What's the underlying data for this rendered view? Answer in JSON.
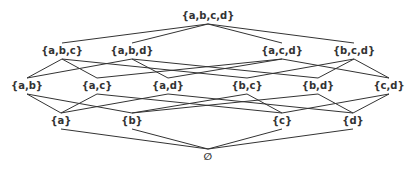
{
  "diagram": {
    "title": "",
    "type": "hasse-diagram-powerset",
    "line_color": "#333333",
    "text_color": "#333333",
    "nodes": [
      {
        "id": "abcd",
        "label": "{a,b,c,d}",
        "x": 208,
        "y": 16
      },
      {
        "id": "abc",
        "label": "{a,b,c}",
        "x": 62,
        "y": 51
      },
      {
        "id": "abd",
        "label": "{a,b,d}",
        "x": 132,
        "y": 51
      },
      {
        "id": "acd",
        "label": "{a,c,d}",
        "x": 282,
        "y": 51
      },
      {
        "id": "bcd",
        "label": "{b,c,d}",
        "x": 354,
        "y": 51
      },
      {
        "id": "ab",
        "label": "{a,b}",
        "x": 27,
        "y": 86
      },
      {
        "id": "ac",
        "label": "{a,c}",
        "x": 97,
        "y": 86
      },
      {
        "id": "ad",
        "label": "{a,d}",
        "x": 168,
        "y": 86
      },
      {
        "id": "bc",
        "label": "{b,c}",
        "x": 247,
        "y": 86
      },
      {
        "id": "bd",
        "label": "{b,d}",
        "x": 318,
        "y": 86
      },
      {
        "id": "cd",
        "label": "{c,d}",
        "x": 389,
        "y": 86
      },
      {
        "id": "a",
        "label": "{a}",
        "x": 61,
        "y": 121
      },
      {
        "id": "b",
        "label": "{b}",
        "x": 132,
        "y": 121
      },
      {
        "id": "c",
        "label": "{c}",
        "x": 282,
        "y": 121
      },
      {
        "id": "d",
        "label": "{d}",
        "x": 353,
        "y": 121
      },
      {
        "id": "empty",
        "label": "∅",
        "x": 208,
        "y": 157
      }
    ],
    "edges": [
      [
        "abcd",
        "abc"
      ],
      [
        "abcd",
        "abd"
      ],
      [
        "abcd",
        "acd"
      ],
      [
        "abcd",
        "bcd"
      ],
      [
        "abc",
        "ab"
      ],
      [
        "abc",
        "ac"
      ],
      [
        "abc",
        "bc"
      ],
      [
        "abd",
        "ab"
      ],
      [
        "abd",
        "ad"
      ],
      [
        "abd",
        "bd"
      ],
      [
        "acd",
        "ac"
      ],
      [
        "acd",
        "ad"
      ],
      [
        "acd",
        "cd"
      ],
      [
        "bcd",
        "bc"
      ],
      [
        "bcd",
        "bd"
      ],
      [
        "bcd",
        "cd"
      ],
      [
        "ab",
        "a"
      ],
      [
        "ab",
        "b"
      ],
      [
        "ac",
        "a"
      ],
      [
        "ac",
        "c"
      ],
      [
        "ad",
        "a"
      ],
      [
        "ad",
        "d"
      ],
      [
        "bc",
        "b"
      ],
      [
        "bc",
        "c"
      ],
      [
        "bd",
        "b"
      ],
      [
        "bd",
        "d"
      ],
      [
        "cd",
        "c"
      ],
      [
        "cd",
        "d"
      ],
      [
        "a",
        "empty"
      ],
      [
        "b",
        "empty"
      ],
      [
        "c",
        "empty"
      ],
      [
        "d",
        "empty"
      ]
    ]
  }
}
